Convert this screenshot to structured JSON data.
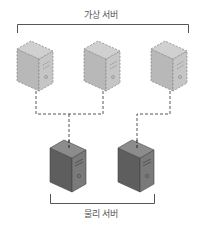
{
  "diagram": {
    "top_label": "가상 서버",
    "bottom_label": "물리 서버",
    "virtual_servers": [
      {
        "name": "virtual-server-1"
      },
      {
        "name": "virtual-server-2"
      },
      {
        "name": "virtual-server-3"
      }
    ],
    "physical_servers": [
      {
        "name": "physical-server-1"
      },
      {
        "name": "physical-server-2"
      }
    ],
    "colors": {
      "virtual_fill": "#b5b5b5",
      "physical_fill": "#6a6a6a",
      "line": "#555555"
    }
  }
}
